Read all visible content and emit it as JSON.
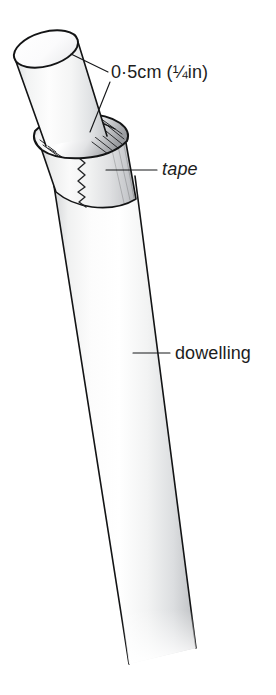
{
  "figure": {
    "background_color": "#ffffff",
    "ink_color": "#131415",
    "text_color": "#1d1d1d"
  },
  "labels": {
    "diameter": {
      "text": "0·5cm (¼in)",
      "style": "roman",
      "x": 111,
      "y": 78
    },
    "tape": {
      "text": "tape",
      "style": "italic",
      "x": 162,
      "y": 175
    },
    "dowelling": {
      "text": "dowelling",
      "style": "roman",
      "x": 175,
      "y": 359
    }
  },
  "leaders": [
    {
      "name": "leader-diameter-to-rim",
      "points": "108,72 71,54"
    },
    {
      "name": "leader-diameter-to-joint",
      "points": "110,82 90,132"
    },
    {
      "name": "leader-tape",
      "points": "157,170 106,170"
    },
    {
      "name": "leader-dowelling",
      "points": "170,353 133,353"
    }
  ],
  "parts": {
    "top_dowel": {
      "name": "upper dowelling end",
      "fill_light": "#fbfbfb",
      "fill_mid": "#e6e7e8",
      "fill_shadow": "#c9cbcd"
    },
    "tape_band": {
      "name": "tape wrapped band",
      "fill_light": "#f7f7f7",
      "fill_mid": "#dcdddf",
      "fill_shadow": "#b9bbbe",
      "edge_detail": "torn zigzag seam"
    },
    "lower_dowel": {
      "name": "main dowelling rod",
      "fill_light": "#fdfdfd",
      "fill_mid": "#ececec",
      "fill_shadow": "#c4c6c8"
    }
  }
}
